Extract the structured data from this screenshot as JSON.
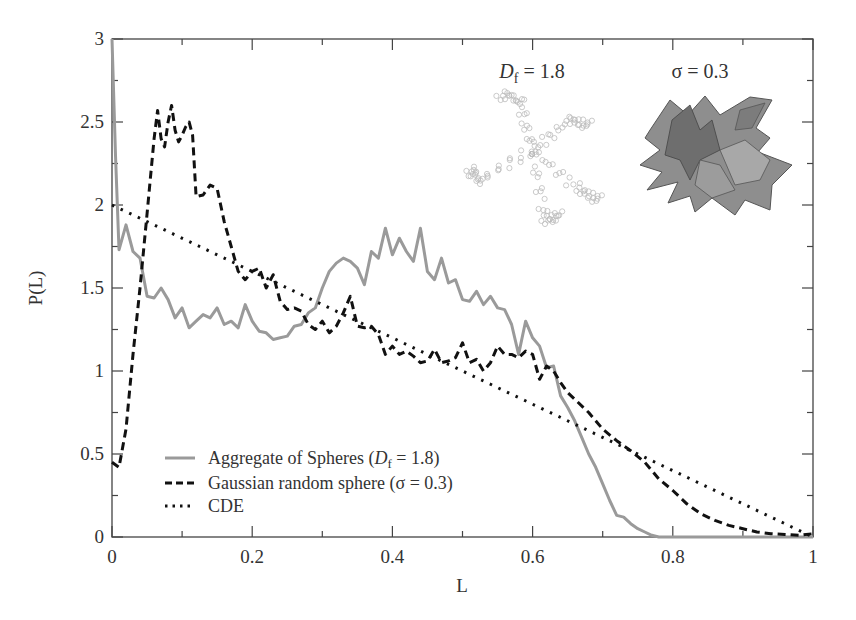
{
  "chart_data": {
    "type": "line",
    "title": "",
    "xlabel": "L",
    "ylabel": "P(L)",
    "xlim": [
      0,
      1
    ],
    "ylim": [
      0,
      3
    ],
    "xticks": [
      0,
      0.2,
      0.4,
      0.6,
      0.8,
      1
    ],
    "xtick_labels": [
      "0",
      "0.2",
      "0.4",
      "0.6",
      "0.8",
      "1"
    ],
    "yticks": [
      0,
      0.5,
      1,
      1.5,
      2,
      2.5,
      3
    ],
    "ytick_labels": [
      "0",
      "0.5",
      "1",
      "1.5",
      "2",
      "2.5",
      "3"
    ],
    "grid": false,
    "legend_position": "lower left",
    "series": [
      {
        "name": "Aggregate of Spheres (Df = 1.8)",
        "style": "solid",
        "color": "#9a9a9a",
        "x": [
          0,
          0.005,
          0.01,
          0.02,
          0.03,
          0.04,
          0.05,
          0.06,
          0.07,
          0.08,
          0.09,
          0.1,
          0.11,
          0.12,
          0.13,
          0.14,
          0.15,
          0.16,
          0.17,
          0.18,
          0.19,
          0.2,
          0.21,
          0.22,
          0.23,
          0.24,
          0.25,
          0.26,
          0.27,
          0.28,
          0.29,
          0.3,
          0.31,
          0.32,
          0.33,
          0.34,
          0.35,
          0.36,
          0.37,
          0.38,
          0.39,
          0.4,
          0.41,
          0.42,
          0.43,
          0.44,
          0.45,
          0.46,
          0.47,
          0.48,
          0.49,
          0.5,
          0.51,
          0.52,
          0.53,
          0.54,
          0.55,
          0.56,
          0.57,
          0.58,
          0.59,
          0.6,
          0.61,
          0.62,
          0.63,
          0.64,
          0.65,
          0.66,
          0.67,
          0.68,
          0.69,
          0.7,
          0.71,
          0.72,
          0.73,
          0.74,
          0.75,
          0.76,
          0.77,
          0.78,
          0.79,
          0.8,
          0.85,
          0.9,
          0.95,
          1.0
        ],
        "values": [
          3.0,
          2.3,
          1.73,
          1.88,
          1.72,
          1.68,
          1.45,
          1.44,
          1.5,
          1.43,
          1.32,
          1.38,
          1.26,
          1.3,
          1.34,
          1.32,
          1.38,
          1.28,
          1.3,
          1.26,
          1.4,
          1.3,
          1.24,
          1.23,
          1.19,
          1.2,
          1.21,
          1.27,
          1.28,
          1.35,
          1.38,
          1.5,
          1.6,
          1.65,
          1.68,
          1.66,
          1.62,
          1.52,
          1.72,
          1.68,
          1.86,
          1.7,
          1.8,
          1.72,
          1.66,
          1.86,
          1.6,
          1.55,
          1.68,
          1.53,
          1.55,
          1.43,
          1.42,
          1.48,
          1.4,
          1.45,
          1.38,
          1.37,
          1.28,
          1.1,
          1.3,
          1.2,
          1.15,
          1.02,
          1.03,
          0.85,
          0.78,
          0.7,
          0.6,
          0.5,
          0.42,
          0.32,
          0.22,
          0.13,
          0.12,
          0.08,
          0.05,
          0.03,
          0.01,
          0.0,
          0.0,
          0.0,
          0.0,
          0.0,
          0.0,
          0.0
        ]
      },
      {
        "name": "Gaussian random sphere (σ = 0.3)",
        "style": "dashed",
        "color": "#111111",
        "x": [
          0,
          0.01,
          0.02,
          0.03,
          0.04,
          0.05,
          0.06,
          0.065,
          0.07,
          0.075,
          0.08,
          0.085,
          0.09,
          0.095,
          0.1,
          0.105,
          0.11,
          0.115,
          0.12,
          0.13,
          0.14,
          0.15,
          0.16,
          0.17,
          0.18,
          0.19,
          0.2,
          0.21,
          0.22,
          0.23,
          0.24,
          0.25,
          0.26,
          0.27,
          0.28,
          0.29,
          0.3,
          0.31,
          0.32,
          0.33,
          0.34,
          0.35,
          0.36,
          0.37,
          0.38,
          0.39,
          0.4,
          0.41,
          0.42,
          0.43,
          0.44,
          0.45,
          0.46,
          0.47,
          0.48,
          0.49,
          0.5,
          0.51,
          0.52,
          0.53,
          0.54,
          0.55,
          0.56,
          0.57,
          0.58,
          0.59,
          0.6,
          0.61,
          0.62,
          0.63,
          0.64,
          0.65,
          0.66,
          0.68,
          0.7,
          0.72,
          0.74,
          0.76,
          0.78,
          0.8,
          0.82,
          0.84,
          0.86,
          0.88,
          0.9,
          0.92,
          0.94,
          0.96,
          0.98,
          1.0
        ],
        "values": [
          0.45,
          0.42,
          0.65,
          1.1,
          1.5,
          1.95,
          2.4,
          2.57,
          2.4,
          2.35,
          2.5,
          2.6,
          2.45,
          2.38,
          2.42,
          2.47,
          2.5,
          2.42,
          2.05,
          2.06,
          2.12,
          2.1,
          1.9,
          1.75,
          1.6,
          1.55,
          1.6,
          1.62,
          1.5,
          1.58,
          1.42,
          1.37,
          1.38,
          1.36,
          1.28,
          1.25,
          1.3,
          1.23,
          1.27,
          1.35,
          1.45,
          1.27,
          1.26,
          1.27,
          1.22,
          1.1,
          1.15,
          1.1,
          1.12,
          1.09,
          1.05,
          1.06,
          1.13,
          1.05,
          1.06,
          1.08,
          1.17,
          1.05,
          1.07,
          1.0,
          1.05,
          1.15,
          1.1,
          1.1,
          1.08,
          1.12,
          1.1,
          0.95,
          1.03,
          1.0,
          0.93,
          0.87,
          0.83,
          0.75,
          0.65,
          0.58,
          0.52,
          0.45,
          0.35,
          0.28,
          0.2,
          0.14,
          0.1,
          0.07,
          0.05,
          0.03,
          0.02,
          0.015,
          0.01,
          0.02
        ]
      },
      {
        "name": "CDE",
        "style": "dotted",
        "color": "#111111",
        "x": [
          0,
          1
        ],
        "values": [
          2.0,
          0.0
        ]
      }
    ],
    "annotations": [
      {
        "text": "Df = 1.8",
        "position": "upper right, above fractal aggregate image"
      },
      {
        "text": "σ = 0.3",
        "position": "upper right, above Gaussian random sphere image"
      }
    ]
  },
  "legend": {
    "items": [
      {
        "label_prefix": "Aggregate of Spheres (",
        "label_var": "D",
        "label_sub": "f",
        "label_suffix": " = 1.8)"
      },
      {
        "label": "Gaussian random sphere (σ = 0.3)"
      },
      {
        "label": "CDE"
      }
    ]
  },
  "insets": {
    "aggregate": {
      "label_var": "D",
      "label_sub": "f",
      "label_suffix": " = 1.8"
    },
    "sphere": {
      "label": "σ = 0.3"
    }
  },
  "axes": {
    "xlabel": "L",
    "ylabel": "P(L)"
  }
}
